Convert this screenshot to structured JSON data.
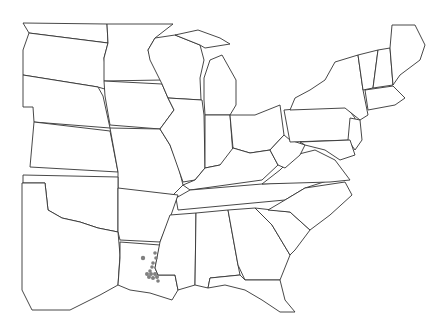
{
  "map": {
    "region": "Eastern United States",
    "type": "state boundary outline map with occurrence points",
    "colors": {
      "background": "#ffffff",
      "boundary": "#333333",
      "occurrence": "#808080"
    },
    "occurrences": [
      {
        "x": 143,
        "y": 258,
        "r": 2.2
      },
      {
        "x": 155,
        "y": 253,
        "r": 1.8
      },
      {
        "x": 156,
        "y": 258,
        "r": 1.8
      },
      {
        "x": 153,
        "y": 263,
        "r": 1.8
      },
      {
        "x": 152,
        "y": 267,
        "r": 1.8
      },
      {
        "x": 150,
        "y": 271,
        "r": 1.8
      },
      {
        "x": 147,
        "y": 274,
        "r": 2
      },
      {
        "x": 151,
        "y": 274,
        "r": 2
      },
      {
        "x": 155,
        "y": 274,
        "r": 2
      },
      {
        "x": 149,
        "y": 277,
        "r": 2
      },
      {
        "x": 153,
        "y": 278,
        "r": 2
      },
      {
        "x": 157,
        "y": 277,
        "r": 2
      },
      {
        "x": 158,
        "y": 281,
        "r": 1.8
      }
    ]
  }
}
